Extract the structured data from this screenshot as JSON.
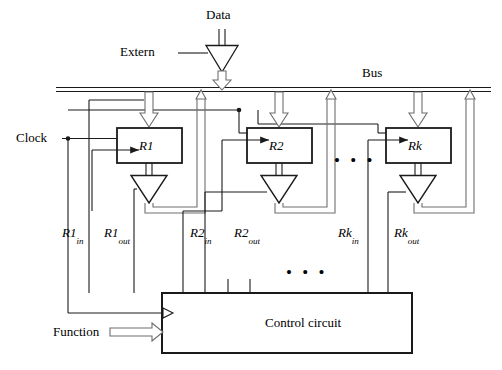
{
  "figure": {
    "type": "block-diagram",
    "bus_label": "Bus",
    "data_label": "Data",
    "extern_label": "Extern",
    "clock_label": "Clock",
    "function_label": "Function",
    "control_label": "Control circuit",
    "ellipsis": "• • •",
    "registers": [
      {
        "name": "R1",
        "in_label": "R1",
        "in_sub": "in",
        "out_label": "R1",
        "out_sub": "out"
      },
      {
        "name": "R2",
        "in_label": "R2",
        "in_sub": "in",
        "out_label": "R2",
        "out_sub": "out"
      },
      {
        "name": "Rk",
        "in_label": "Rk",
        "in_sub": "in",
        "out_label": "Rk",
        "out_sub": "out"
      }
    ],
    "colors": {
      "line": "#1a1a1a",
      "hollow_arrow_stroke": "#6f6f6f",
      "background": "#ffffff",
      "text": "#000000"
    }
  }
}
